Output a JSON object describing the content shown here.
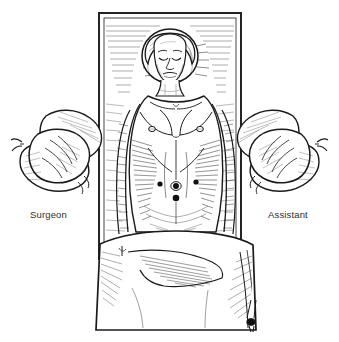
{
  "figure": {
    "type": "medical-line-illustration",
    "background_color": "#ffffff",
    "ink_color": "#1a1a1a",
    "label_color": "#2e2e2e",
    "style": "pen-and-ink hatched line drawing"
  },
  "labels": {
    "surgeon": "Surgeon",
    "assistant": "Assistant"
  },
  "scene": {
    "operating_table": {
      "name": "operating table",
      "shape": "vertical rectangle with drawn double-line border",
      "x": 98,
      "y": 12,
      "width": 144,
      "height": 248
    },
    "patient": {
      "name": "patient",
      "position": "supine, head at top, arms tucked at sides",
      "head_covering": "surgical cap",
      "eyes": "closed"
    },
    "surgical_drape": {
      "name": "surgical drape",
      "position": "covering lower body and table foot"
    },
    "surgeon_arms": {
      "name": "surgeon gloved arms",
      "side": "left of patient"
    },
    "assistant_arms": {
      "name": "assistant gloved arms",
      "side": "right of patient"
    }
  },
  "port_sites": [
    {
      "name": "left lateral port",
      "cx": 160,
      "cy": 184,
      "r": 2.6
    },
    {
      "name": "umbilical port",
      "cx": 176,
      "cy": 186,
      "r": 3.0
    },
    {
      "name": "infraumbilical port",
      "cx": 176,
      "cy": 198,
      "r": 3.2
    },
    {
      "name": "right lateral port",
      "cx": 196,
      "cy": 182,
      "r": 2.6
    }
  ]
}
